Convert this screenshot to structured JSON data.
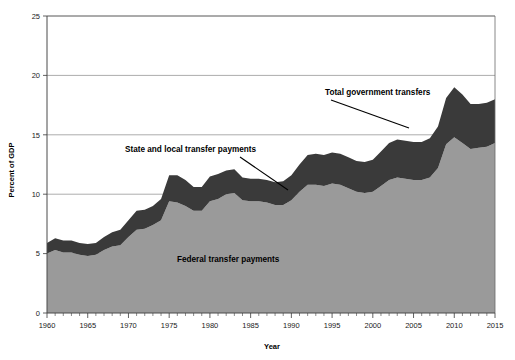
{
  "chart_data": {
    "type": "area",
    "title": "",
    "xlabel": "Year",
    "ylabel": "Percent of GDP",
    "xlim": [
      1960,
      2015
    ],
    "ylim": [
      0,
      25
    ],
    "ytick_values": [
      0,
      5,
      10,
      15,
      20,
      25
    ],
    "ytick_labels": [
      "0",
      "5",
      "10",
      "15",
      "20",
      "25"
    ],
    "xtick_values": [
      1960,
      1965,
      1970,
      1975,
      1980,
      1985,
      1990,
      1995,
      2000,
      2005,
      2010,
      2015
    ],
    "xtick_labels": [
      "1960",
      "1965",
      "1970",
      "1975",
      "1980",
      "1985",
      "1990",
      "1995",
      "2000",
      "2005",
      "2010",
      "2015"
    ],
    "minor_xticks_interval": 1,
    "grid": "horizontal",
    "legend_position": "inline-annotations",
    "stacked": true,
    "x": [
      1960,
      1961,
      1962,
      1963,
      1964,
      1965,
      1966,
      1967,
      1968,
      1969,
      1970,
      1971,
      1972,
      1973,
      1974,
      1975,
      1976,
      1977,
      1978,
      1979,
      1980,
      1981,
      1982,
      1983,
      1984,
      1985,
      1986,
      1987,
      1988,
      1989,
      1990,
      1991,
      1992,
      1993,
      1994,
      1995,
      1996,
      1997,
      1998,
      1999,
      2000,
      2001,
      2002,
      2003,
      2004,
      2005,
      2006,
      2007,
      2008,
      2009,
      2010,
      2011,
      2012,
      2013,
      2014,
      2015
    ],
    "series": [
      {
        "name": "Federal transfer payments",
        "color": "#9a9a9a",
        "values": [
          5.0,
          5.3,
          5.1,
          5.1,
          4.9,
          4.8,
          4.9,
          5.3,
          5.6,
          5.7,
          6.4,
          7.0,
          7.1,
          7.4,
          7.8,
          9.4,
          9.3,
          9.0,
          8.6,
          8.6,
          9.4,
          9.6,
          10.0,
          10.1,
          9.5,
          9.4,
          9.4,
          9.3,
          9.1,
          9.1,
          9.5,
          10.2,
          10.8,
          10.8,
          10.7,
          10.9,
          10.8,
          10.5,
          10.2,
          10.1,
          10.2,
          10.7,
          11.2,
          11.4,
          11.3,
          11.2,
          11.2,
          11.4,
          12.2,
          14.2,
          14.8,
          14.3,
          13.8,
          13.9,
          14.0,
          14.3
        ]
      },
      {
        "name": "State and local transfer payments",
        "color": "#3a3a3a",
        "values": [
          0.9,
          1.0,
          1.0,
          1.0,
          1.0,
          1.0,
          1.0,
          1.1,
          1.2,
          1.3,
          1.4,
          1.6,
          1.6,
          1.6,
          1.8,
          2.2,
          2.3,
          2.2,
          2.0,
          2.0,
          2.1,
          2.1,
          2.0,
          2.0,
          1.9,
          1.9,
          1.9,
          1.9,
          1.9,
          2.0,
          2.1,
          2.3,
          2.5,
          2.6,
          2.6,
          2.6,
          2.6,
          2.6,
          2.6,
          2.6,
          2.7,
          2.9,
          3.1,
          3.2,
          3.2,
          3.2,
          3.2,
          3.3,
          3.5,
          3.9,
          4.2,
          4.1,
          3.8,
          3.7,
          3.7,
          3.7
        ]
      }
    ],
    "total_label": "Total government transfers",
    "totals": [
      5.9,
      6.3,
      6.1,
      6.1,
      5.9,
      5.8,
      5.9,
      6.4,
      6.8,
      7.0,
      7.8,
      8.6,
      8.7,
      9.0,
      9.6,
      11.6,
      11.6,
      11.2,
      10.6,
      10.6,
      11.5,
      11.7,
      12.0,
      12.1,
      11.4,
      11.3,
      11.3,
      11.2,
      11.0,
      11.1,
      11.6,
      12.5,
      13.3,
      13.4,
      13.3,
      13.5,
      13.4,
      13.1,
      12.8,
      12.7,
      12.9,
      13.6,
      14.3,
      14.6,
      14.5,
      14.4,
      14.4,
      14.7,
      15.7,
      18.1,
      19.0,
      18.4,
      17.6,
      17.6,
      17.7,
      18.0
    ]
  },
  "annotations": [
    {
      "id": "total-government-transfers",
      "text": "Total government transfers"
    },
    {
      "id": "state-and-local-transfer-payments",
      "text": "State and local transfer payments"
    },
    {
      "id": "federal-transfer-payments",
      "text": "Federal transfer payments"
    }
  ]
}
